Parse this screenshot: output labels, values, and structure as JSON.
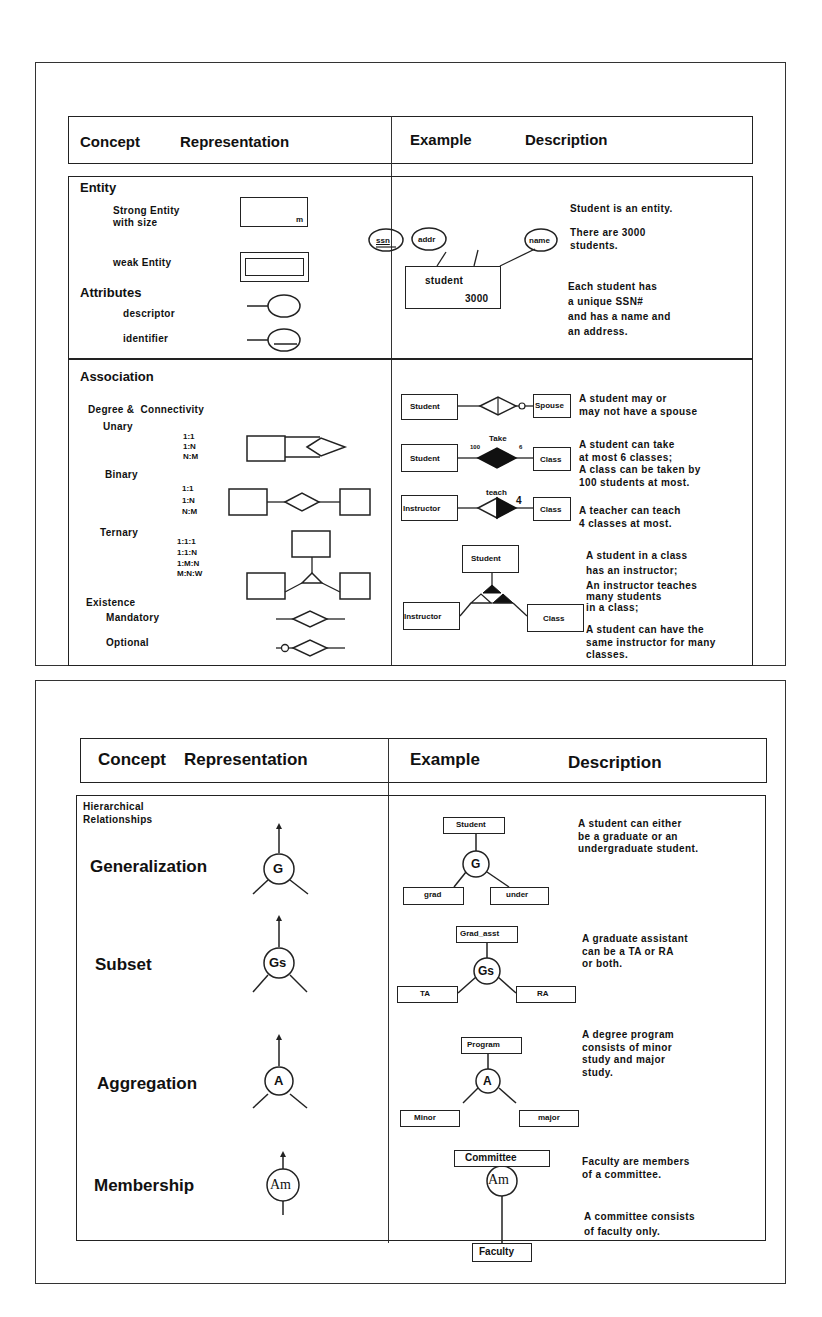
{
  "figure1": {
    "header": {
      "concept": "Concept",
      "representation": "Representation",
      "example": "Example",
      "description": "Description"
    },
    "entity": {
      "title": "Entity",
      "strong_entity": "Strong Entity\nwith size",
      "size_marker": "m",
      "weak_entity": "weak Entity",
      "attributes_title": "Attributes",
      "descriptor": "descriptor",
      "identifier": "identifier",
      "example": {
        "attrs": [
          "ssn",
          "addr",
          "name"
        ],
        "entity_name": "student",
        "entity_size": "3000"
      },
      "descriptions": [
        "Student is an entity.",
        "There are 3000\nstudents.",
        "Each student has\na unique SSN#\nand has a name and\nan address."
      ]
    },
    "association": {
      "title": "Association",
      "degree_connectivity": "Degree &  Connectivity",
      "unary": "Unary",
      "unary_ratios": "1:1\n1:N\nN:M",
      "binary": "Binary",
      "binary_ratios": "1:1\n1:N\nN:M",
      "ternary": "Ternary",
      "ternary_ratios": "1:1:1\n1:1:N\n1:M:N\nM:N:W",
      "existence": "Existence",
      "mandatory": "Mandatory",
      "optional": "Optional",
      "examples": [
        {
          "left": "Student",
          "right": "Spouse",
          "description": "A student may or\nmay not have a spouse"
        },
        {
          "left": "Student",
          "right": "Class",
          "rel_label": "Take",
          "left_card": "100",
          "right_card": "6",
          "description": "A student can take\nat most 6 classes;\nA class can be taken by\n100 students at most."
        },
        {
          "left": "Instructor",
          "right": "Class",
          "rel_label": "teach",
          "right_card": "4",
          "description": "A teacher can teach\n4 classes at most."
        },
        {
          "top": "Student",
          "left": "Instructor",
          "right": "Class",
          "descriptions": [
            "A student in a class\nhas an instructor;",
            "An instructor teaches\nmany students\nin a class;",
            "A student can have the\nsame instructor for many\nclasses."
          ]
        }
      ]
    }
  },
  "figure2": {
    "header": {
      "concept": "Concept",
      "representation": "Representation",
      "example": "Example",
      "description": "Description"
    },
    "section_title": "Hierarchical\nRelationships",
    "rows": [
      {
        "concept": "Generalization",
        "symbol": "G",
        "example": {
          "parent": "Student",
          "children": [
            "grad",
            "under"
          ]
        },
        "description": "A student can either\nbe a graduate or an\nundergraduate student."
      },
      {
        "concept": "Subset",
        "symbol": "Gs",
        "example": {
          "parent": "Grad_asst",
          "children": [
            "TA",
            "RA"
          ]
        },
        "description": "A graduate assistant\ncan be a TA or RA\nor both."
      },
      {
        "concept": "Aggregation",
        "symbol": "A",
        "example": {
          "parent": "Program",
          "children": [
            "Minor",
            "major"
          ]
        },
        "description": "A degree program\nconsists of minor\nstudy and major\nstudy."
      },
      {
        "concept": "Membership",
        "symbol": "Am",
        "example": {
          "parent": "Committee",
          "children": [
            "Faculty"
          ]
        },
        "descriptions": [
          "Faculty are members\nof a committee.",
          "A committee consists\nof faculty only."
        ]
      }
    ]
  }
}
